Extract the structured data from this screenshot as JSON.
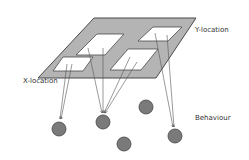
{
  "diagram": {
    "labels": {
      "x_location": "X-location",
      "y_location": "Y-location",
      "behaviour": "Behaviour"
    },
    "colors": {
      "plane_fill": "#b4b4b4",
      "plane_stroke": "#4a4a4a",
      "field_fill": "#ffffff",
      "node_fill": "#7a7a7a",
      "node_stroke": "#444444",
      "arrow": "#555555"
    },
    "receptive_fields": 4,
    "behaviour_nodes": 5
  }
}
